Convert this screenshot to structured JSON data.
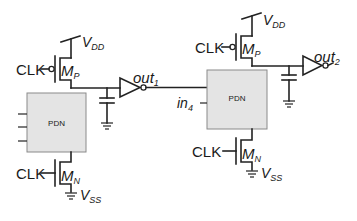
{
  "diagram": {
    "stage1": {
      "vdd": "V",
      "vdd_sub": "DD",
      "clk_p": "CLK",
      "mp": "M",
      "mp_sub": "P",
      "pdn": "PDN",
      "clk_n": "CLK",
      "mn": "M",
      "mn_sub": "N",
      "vss": "V",
      "vss_sub": "SS",
      "out": "out",
      "out_sub": "1"
    },
    "stage2": {
      "vdd": "V",
      "vdd_sub": "DD",
      "clk_p": "CLK",
      "mp": "M",
      "mp_sub": "P",
      "pdn": "PDN",
      "in": "in",
      "in_sub": "4",
      "clk_n": "CLK",
      "mn": "M",
      "mn_sub": "N",
      "vss": "V",
      "vss_sub": "SS",
      "out": "out",
      "out_sub": "2"
    },
    "colors": {
      "wire": "#222222",
      "pdn_fill": "#e4e4e4",
      "pdn_border": "#8a8a8a"
    }
  }
}
